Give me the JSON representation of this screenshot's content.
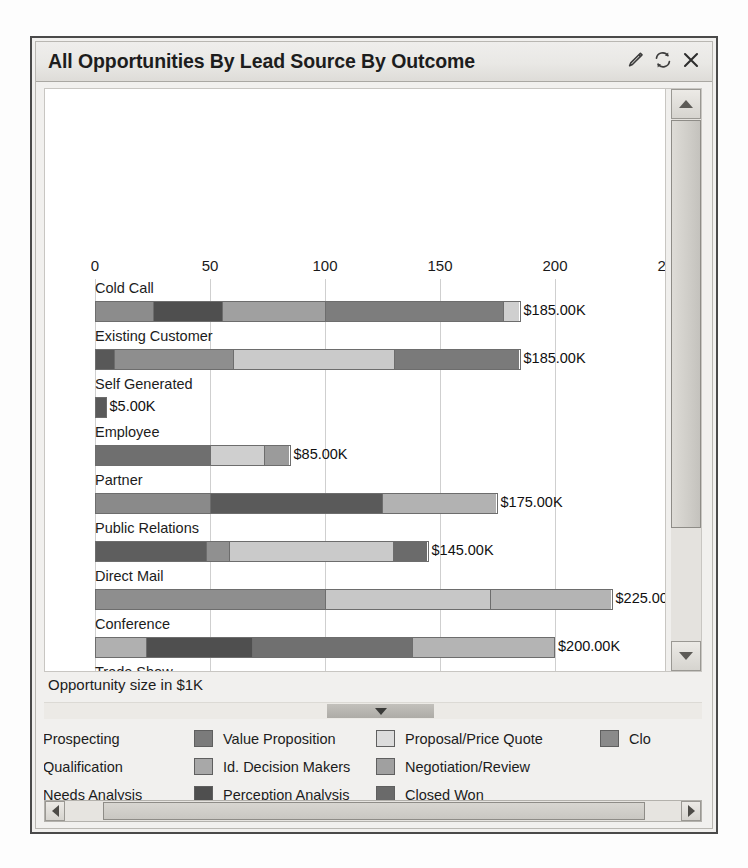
{
  "window": {
    "title": "All Opportunities By Lead Source By Outcome",
    "icons": [
      {
        "name": "edit-pencil-icon",
        "label": "Edit"
      },
      {
        "name": "refresh-icon",
        "label": "Refresh"
      },
      {
        "name": "close-icon",
        "label": "Close"
      }
    ]
  },
  "chart_data": {
    "type": "bar",
    "orientation": "horizontal",
    "stacked": true,
    "title": "All Opportunities By Lead Source By Outcome",
    "xlabel": "Opportunity size in $1K",
    "ylabel": "",
    "xlim": [
      0,
      250
    ],
    "xticks": [
      0,
      50,
      100,
      150,
      200,
      250
    ],
    "xtick_labels": [
      "0",
      "50",
      "100",
      "150",
      "200",
      "250"
    ],
    "grid": true,
    "legend_position": "bottom",
    "categories": [
      "Cold Call",
      "Existing Customer",
      "Self Generated",
      "Employee",
      "Partner",
      "Public Relations",
      "Direct Mail",
      "Conference",
      "Trade Show",
      "Web Site"
    ],
    "totals": [
      185,
      185,
      5,
      85,
      175,
      145,
      225,
      200,
      100,
      100
    ],
    "total_labels": [
      "$185.00K",
      "$185.00K",
      "$5.00K",
      "$85.00K",
      "$175.00K",
      "$145.00K",
      "$225.00K",
      "$200.00K",
      "$100.00K",
      "$100.00K"
    ],
    "series": [
      {
        "name": "Prospecting",
        "color": "#8c8c8c"
      },
      {
        "name": "Qualification",
        "color": "#b0b0b0"
      },
      {
        "name": "Needs Analysis",
        "color": "#9a9a9a"
      },
      {
        "name": "Value Proposition",
        "color": "#777777"
      },
      {
        "name": "Id. Decision Makers",
        "color": "#a8a8a8"
      },
      {
        "name": "Perception Analysis",
        "color": "#4f4f4f"
      },
      {
        "name": "Proposal/Price Quote",
        "color": "#dcdcdc"
      },
      {
        "name": "Negotiation/Review",
        "color": "#a0a0a0"
      },
      {
        "name": "Closed Won",
        "color": "#6a6a6a"
      },
      {
        "name": "Closed Lost",
        "color": "#8a8a8a"
      }
    ],
    "bars": [
      {
        "category": "Cold Call",
        "total": 185,
        "total_label": "$185.00K",
        "segments": [
          {
            "series": "Prospecting",
            "value": 25,
            "color": "#8c8c8c"
          },
          {
            "series": "Perception Analysis",
            "value": 30,
            "color": "#4f4f4f"
          },
          {
            "series": "Id. Decision Makers",
            "value": 45,
            "color": "#a0a0a0"
          },
          {
            "series": "Value Proposition",
            "value": 78,
            "color": "#7d7d7d"
          },
          {
            "series": "Proposal/Price Quote",
            "value": 7,
            "color": "#cfcfcf"
          }
        ]
      },
      {
        "category": "Existing Customer",
        "total": 185,
        "total_label": "$185.00K",
        "segments": [
          {
            "series": "Perception Analysis",
            "value": 8,
            "color": "#585858"
          },
          {
            "series": "Prospecting",
            "value": 52,
            "color": "#8e8e8e"
          },
          {
            "series": "Proposal/Price Quote",
            "value": 70,
            "color": "#cacaca"
          },
          {
            "series": "Value Proposition",
            "value": 55,
            "color": "#7a7a7a"
          }
        ]
      },
      {
        "category": "Self Generated",
        "total": 5,
        "total_label": "$5.00K",
        "segments": [
          {
            "series": "Perception Analysis",
            "value": 5,
            "color": "#5a5a5a"
          }
        ]
      },
      {
        "category": "Employee",
        "total": 85,
        "total_label": "$85.00K",
        "segments": [
          {
            "series": "Needs Analysis",
            "value": 50,
            "color": "#6f6f6f"
          },
          {
            "series": "Proposal/Price Quote",
            "value": 24,
            "color": "#cfcfcf"
          },
          {
            "series": "Negotiation/Review",
            "value": 11,
            "color": "#9b9b9b"
          }
        ]
      },
      {
        "category": "Partner",
        "total": 175,
        "total_label": "$175.00K",
        "segments": [
          {
            "series": "Prospecting",
            "value": 50,
            "color": "#8a8a8a"
          },
          {
            "series": "Perception Analysis",
            "value": 75,
            "color": "#5a5a5a"
          },
          {
            "series": "Negotiation/Review",
            "value": 50,
            "color": "#b2b2b2"
          }
        ]
      },
      {
        "category": "Public Relations",
        "total": 145,
        "total_label": "$145.00K",
        "segments": [
          {
            "series": "Perception Analysis",
            "value": 48,
            "color": "#5e5e5e"
          },
          {
            "series": "Negotiation/Review",
            "value": 10,
            "color": "#909090"
          },
          {
            "series": "Proposal/Price Quote",
            "value": 72,
            "color": "#cacaca"
          },
          {
            "series": "Closed Won",
            "value": 15,
            "color": "#6b6b6b"
          }
        ]
      },
      {
        "category": "Direct Mail",
        "total": 225,
        "total_label": "$225.00K",
        "segments": [
          {
            "series": "Prospecting",
            "value": 100,
            "color": "#8e8e8e"
          },
          {
            "series": "Proposal/Price Quote",
            "value": 72,
            "color": "#c7c7c7"
          },
          {
            "series": "Negotiation/Review",
            "value": 53,
            "color": "#b4b4b4"
          }
        ]
      },
      {
        "category": "Conference",
        "total": 200,
        "total_label": "$200.00K",
        "segments": [
          {
            "series": "Qualification",
            "value": 22,
            "color": "#b0b0b0"
          },
          {
            "series": "Perception Analysis",
            "value": 46,
            "color": "#4f4f4f"
          },
          {
            "series": "Needs Analysis",
            "value": 70,
            "color": "#707070"
          },
          {
            "series": "Negotiation/Review",
            "value": 62,
            "color": "#b4b4b4"
          }
        ]
      },
      {
        "category": "Trade Show",
        "total": 100,
        "total_label": "$100.00K",
        "segments": [
          {
            "series": "Prospecting",
            "value": 100,
            "color": "#8c8c8c"
          }
        ]
      },
      {
        "category": "Web Site",
        "total": 100,
        "total_label": "$100.00K",
        "segments": [
          {
            "series": "Prospecting",
            "value": 50,
            "color": "#8c8c8c"
          },
          {
            "series": "Proposal/Price Quote",
            "value": 50,
            "color": "#c4c4c4"
          }
        ]
      }
    ]
  },
  "legend": {
    "items": [
      {
        "label": "Prospecting",
        "color": "#8c8c8c",
        "swatch_visible": false
      },
      {
        "label": "Value Proposition",
        "color": "#7b7b7b",
        "swatch_visible": true
      },
      {
        "label": "Proposal/Price Quote",
        "color": "#dcdcdc",
        "swatch_visible": true
      },
      {
        "label": "Clo",
        "color": "#8a8a8a",
        "swatch_visible": true
      },
      {
        "label": "Qualification",
        "color": "#b0b0b0",
        "swatch_visible": false
      },
      {
        "label": "Id. Decision Makers",
        "color": "#a8a8a8",
        "swatch_visible": true
      },
      {
        "label": "Negotiation/Review",
        "color": "#a0a0a0",
        "swatch_visible": true
      },
      {
        "label": "Needs Analysis",
        "color": "#9a9a9a",
        "swatch_visible": false
      },
      {
        "label": "Perception Analysis",
        "color": "#4f4f4f",
        "swatch_visible": true
      },
      {
        "label": "Closed Won",
        "color": "#6a6a6a",
        "swatch_visible": true
      }
    ]
  },
  "axis_title": "Opportunity size in $1K"
}
